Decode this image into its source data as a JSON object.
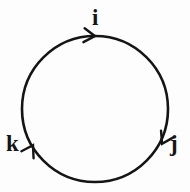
{
  "figure": {
    "background_color": "#fdfdfd",
    "stroke_color": "#141414",
    "label_color": "#141414"
  },
  "nodes": [
    {
      "id": "i",
      "label": "i",
      "position": "top",
      "x": 95,
      "y": 36
    },
    {
      "id": "j",
      "label": "j",
      "position": "lower-right",
      "x": 163,
      "y": 145
    },
    {
      "id": "k",
      "label": "k",
      "position": "lower-left",
      "x": 31,
      "y": 148
    }
  ],
  "cycle": {
    "type": "circle",
    "center_x": 95,
    "center_y": 109,
    "radius": 73,
    "stroke_width": 2.6,
    "direction": "clockwise",
    "arrow_count": 3
  },
  "arrows": [
    {
      "name": "arrow-at-i",
      "x": 93,
      "y": 36,
      "angle_deg": 5,
      "direction": "right"
    },
    {
      "name": "arrow-at-j",
      "x": 163,
      "y": 142,
      "angle_deg": 118,
      "direction": "down-left"
    },
    {
      "name": "arrow-at-k",
      "x": 32,
      "y": 147,
      "angle_deg": -60,
      "direction": "down-right"
    }
  ]
}
